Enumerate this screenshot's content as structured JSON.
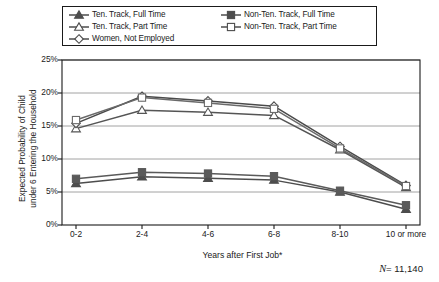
{
  "chart_data": {
    "type": "line",
    "title": "",
    "xlabel": "Years after First Job*",
    "ylabel": "Expected Probability of Child under 6 Entering the Household",
    "ylabel_line1": "Expected Probability of Child",
    "ylabel_line2": "under 6 Entering the Household",
    "categories": [
      "0-2",
      "2-4",
      "4-6",
      "6-8",
      "8-10",
      "10 or more"
    ],
    "ylim": [
      0,
      25
    ],
    "yticks": [
      "0%",
      "5%",
      "10%",
      "15%",
      "20%",
      "25%"
    ],
    "ytick_values": [
      0,
      5,
      10,
      15,
      20,
      25
    ],
    "grid": "horizontal",
    "legend_position": "top",
    "annotation": "N = 11,140",
    "annotation_symbol": "N",
    "annotation_value": "= 11,140",
    "series": [
      {
        "name": "Ten. Track, Full Time",
        "marker": "filled-triangle",
        "color": "#4d4d4d",
        "values": [
          6.3,
          7.3,
          7.1,
          6.8,
          5.0,
          2.4
        ]
      },
      {
        "name": "Ten. Track, Part Time",
        "marker": "open-triangle",
        "color": "#555555",
        "values": [
          14.6,
          17.4,
          17.1,
          16.6,
          11.4,
          5.7
        ]
      },
      {
        "name": "Women, Not Employed",
        "marker": "open-diamond",
        "color": "#4a4a4a",
        "values": [
          15.4,
          19.5,
          18.8,
          18.0,
          11.9,
          6.0
        ]
      },
      {
        "name": "Non-Ten. Track, Full Time",
        "marker": "filled-square",
        "color": "#5a5a5a",
        "values": [
          7.0,
          8.0,
          7.8,
          7.4,
          5.2,
          3.0
        ]
      },
      {
        "name": "Non-Ten. Track, Part Time",
        "marker": "open-square",
        "color": "#6a6a6a",
        "values": [
          15.9,
          19.3,
          18.5,
          17.6,
          11.6,
          5.9
        ]
      }
    ]
  },
  "legend": {
    "entries": [
      {
        "label": "Ten. Track, Full Time",
        "marker": "filled-triangle",
        "column": "a"
      },
      {
        "label": "Non-Ten. Track, Full Time",
        "marker": "filled-square",
        "column": "b"
      },
      {
        "label": "Ten. Track, Part Time",
        "marker": "open-triangle",
        "column": "a"
      },
      {
        "label": "Non-Ten. Track, Part Time",
        "marker": "open-square",
        "column": "b"
      },
      {
        "label": "Women, Not Employed",
        "marker": "open-diamond",
        "column": "a"
      }
    ]
  },
  "colors": {
    "line": "#4d4d4d",
    "frame": "#1a1a1a",
    "grid": "#8c8c8c",
    "text": "#1a1a1a",
    "background": "#ffffff"
  }
}
